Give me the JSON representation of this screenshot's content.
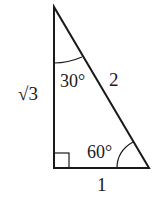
{
  "diagram": {
    "type": "right-triangle",
    "colors": {
      "stroke": "#1a1a1a",
      "background": "#ffffff"
    },
    "vertices": {
      "top": [
        54,
        7
      ],
      "right_angle": [
        54,
        168
      ],
      "bottom_right": [
        149,
        168
      ]
    },
    "labels": {
      "vertical_side": "√3",
      "hypotenuse": "2",
      "base": "1",
      "top_angle": "30°",
      "bottom_right_angle": "60°"
    },
    "markers": {
      "right_angle_box": true,
      "top_angle_arc": true,
      "bottom_right_angle_arc": true
    }
  }
}
